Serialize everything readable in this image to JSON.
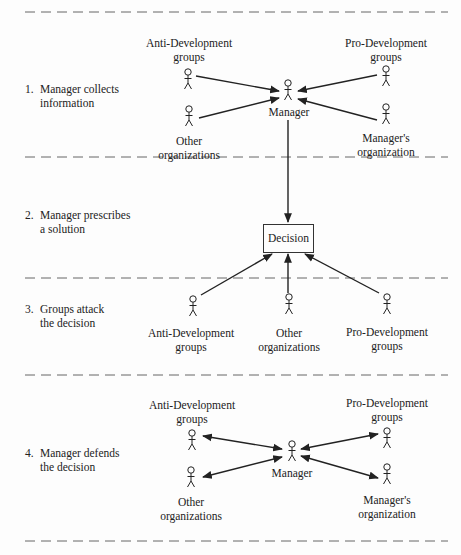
{
  "diagram": {
    "steps": [
      {
        "number": "1.",
        "line1": "Manager collects",
        "line2": "information"
      },
      {
        "number": "2.",
        "line1": "Manager prescribes",
        "line2": "a solution"
      },
      {
        "number": "3.",
        "line1": "Groups attack",
        "line2": "the decision"
      },
      {
        "number": "4.",
        "line1": "Manager defends",
        "line2": "the decision"
      }
    ],
    "section1": {
      "anti_dev": {
        "line1": "Anti-Development",
        "line2": "groups"
      },
      "pro_dev": {
        "line1": "Pro-Development",
        "line2": "groups"
      },
      "other_org": {
        "line1": "Other",
        "line2": "organizations"
      },
      "managers_org": {
        "line1": "Manager's",
        "line2": "organization"
      },
      "manager": "Manager"
    },
    "section2": {
      "decision": "Decision"
    },
    "section3": {
      "anti_dev": {
        "line1": "Anti-Development",
        "line2": "groups"
      },
      "other_org": {
        "line1": "Other",
        "line2": "organizations"
      },
      "pro_dev": {
        "line1": "Pro-Development",
        "line2": "groups"
      }
    },
    "section4": {
      "anti_dev": {
        "line1": "Anti-Development",
        "line2": "groups"
      },
      "pro_dev": {
        "line1": "Pro-Development",
        "line2": "groups"
      },
      "other_org": {
        "line1": "Other",
        "line2": "organizations"
      },
      "managers_org": {
        "line1": "Manager's",
        "line2": "organization"
      },
      "manager": "Manager"
    },
    "colors": {
      "ink": "#222222",
      "dash": "#666666",
      "background": "#fdfdfd"
    }
  }
}
